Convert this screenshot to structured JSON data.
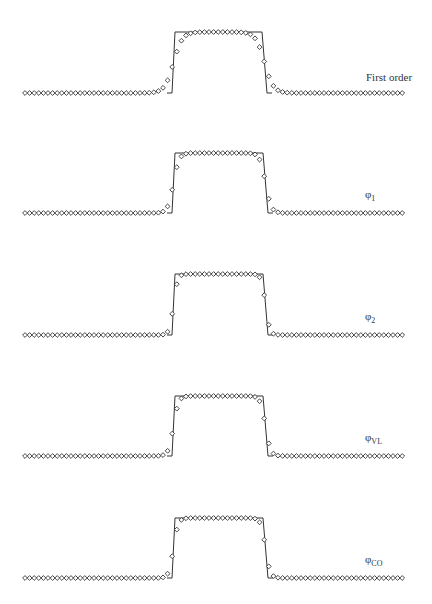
{
  "chart_data": {
    "type": "line",
    "title": "",
    "panels": [
      {
        "label": "First order",
        "label_main": "First order",
        "label_sub": "",
        "baseline_y": 93,
        "top_y": 32,
        "edge_left": [
          172,
          175
        ],
        "edge_right": [
          262,
          267
        ],
        "smearing": 0.55
      },
      {
        "label": "φ1",
        "label_main": "φ",
        "label_sub": "1",
        "baseline_y": 213,
        "top_y": 153,
        "edge_left": [
          172,
          175
        ],
        "edge_right": [
          263,
          268
        ],
        "smearing": 0.3
      },
      {
        "label": "φ2",
        "label_main": "φ",
        "label_sub": "2",
        "baseline_y": 335,
        "top_y": 274,
        "edge_left": [
          172,
          175
        ],
        "edge_right": [
          263,
          268
        ],
        "smearing": 0.18
      },
      {
        "label": "φVL",
        "label_main": "φ",
        "label_sub": "VL",
        "baseline_y": 456,
        "top_y": 396,
        "edge_left": [
          172,
          175
        ],
        "edge_right": [
          263,
          268
        ],
        "smearing": 0.25
      },
      {
        "label": "φCO",
        "label_main": "φ",
        "label_sub": "CO",
        "baseline_y": 578,
        "top_y": 518,
        "edge_left": [
          172,
          175
        ],
        "edge_right": [
          263,
          268
        ],
        "smearing": 0.22
      }
    ],
    "x_range": [
      25,
      405
    ],
    "marker": "diamond",
    "line_color": "#333333",
    "marker_color": "#333333",
    "grid": false,
    "legend_position": "right, per panel"
  }
}
